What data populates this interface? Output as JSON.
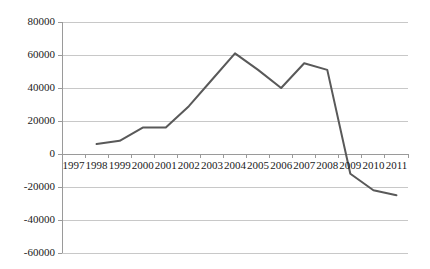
{
  "chart_data": {
    "type": "line",
    "title": "",
    "subtitle": "",
    "xlabel": "",
    "ylabel": "",
    "grid": true,
    "legend": false,
    "legend_position": "none",
    "series_color": "#595959",
    "gridline_color": "#c8c8c8",
    "axis_color": "#9a9a9a",
    "background_color": "#ffffff",
    "categories": [
      "1997",
      "1998",
      "1999",
      "2000",
      "2001",
      "2002",
      "2003",
      "2004",
      "2005",
      "2006",
      "2007",
      "2008",
      "2009",
      "2010",
      "2011"
    ],
    "values": [
      null,
      6000,
      8000,
      16000,
      16000,
      29000,
      45000,
      61000,
      51000,
      40000,
      55000,
      51000,
      -12000,
      -22000,
      -25000
    ],
    "ylim": [
      -60000,
      80000
    ],
    "yticks": [
      80000,
      60000,
      40000,
      20000,
      0,
      -20000,
      -40000,
      -60000
    ],
    "ytick_labels": [
      "80000",
      "60000",
      "40000",
      "20000",
      "0",
      "-20000",
      "-40000",
      "-60000"
    ],
    "xtick_labels": [
      "1997",
      "1998",
      "1999",
      "2000",
      "2001",
      "2002",
      "2003",
      "2004",
      "2005",
      "2006",
      "2007",
      "2008",
      "2009",
      "2010",
      "2011"
    ]
  }
}
